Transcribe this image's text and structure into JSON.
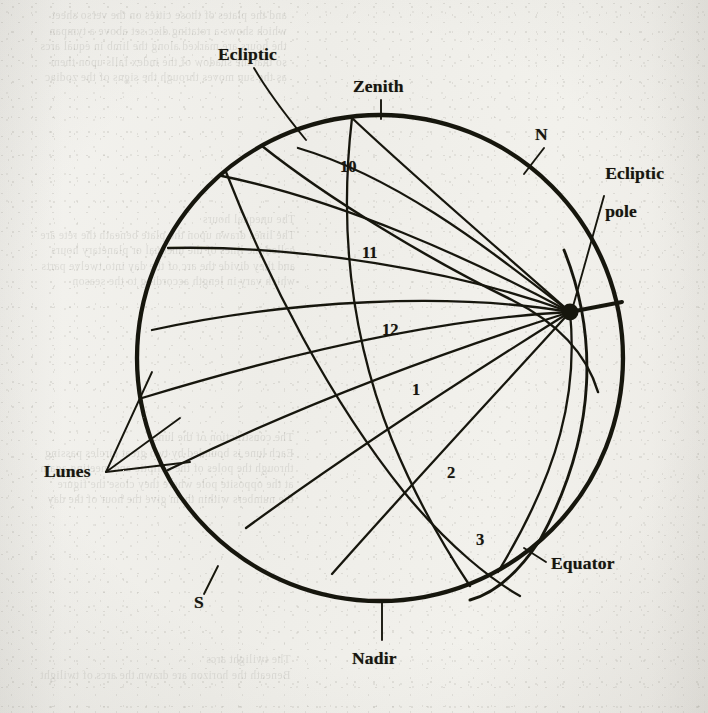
{
  "figure": {
    "kind": "celestial-sphere-diagram",
    "labels": {
      "ecliptic": "Ecliptic",
      "zenith": "Zenith",
      "north": "N",
      "ecliptic_pole_line1": "Ecliptic",
      "ecliptic_pole_line2": "pole",
      "lunes": "Lunes",
      "equator": "Equator",
      "nadir": "Nadir",
      "south": "S"
    },
    "hour_numbers": [
      "10",
      "11",
      "12",
      "1",
      "2",
      "3"
    ],
    "ink_color": "#191710",
    "paper_color": "#f1f0ec"
  },
  "bleed_text": {
    "top_block": "and the plates of those cities on the verso sheet\nwhich shows a rotating disc set above a tympan\nthe hours are marked along the limb in equal arcs\nso that the shadow of the index falls upon them\nas the sun moves through the signs of the zodiac",
    "mid_block": "The unequal hours\nThe lines drawn upon the plate beneath the rete are\ncalled the lines of the unequal or planetary hours\nand they divide the arc of the day into twelve parts\nwhich vary in length according to the season",
    "low_block": "The construction of the lunes\nEach lune is bounded by two great circles passing\nthrough the poles of the ecliptic and meeting again\nat the opposite pole where they close the figure\nthe numbers within them give the hour of the day",
    "bottom_block": "The twilight arcs\nBeneath the horizon are drawn the arcs of twilight"
  }
}
